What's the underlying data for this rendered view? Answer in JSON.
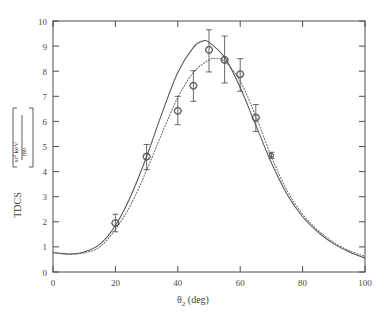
{
  "figure": {
    "background_color": "#ffffff",
    "line_color": "#4d4d4d"
  },
  "chart_data": {
    "type": "scatter",
    "title": "",
    "subtitle": "",
    "xlabel": "θ₂ (deg)",
    "xlabel_symbol": "θ",
    "xlabel_subscript": "2",
    "xlabel_units": "(deg)",
    "ylabel": "TDCS [ mb / (sr² keV) ]",
    "ylabel_main": "TDCS",
    "ylabel_numerator": "mb",
    "ylabel_denominator": "sr² keV",
    "xlim": [
      0,
      100
    ],
    "ylim": [
      0,
      10
    ],
    "xticks": [
      0,
      20,
      40,
      60,
      80,
      100
    ],
    "yticks": [
      0,
      1,
      2,
      3,
      4,
      5,
      6,
      7,
      8,
      9,
      10
    ],
    "xtick_labels": [
      "0",
      "20",
      "40",
      "60",
      "80",
      "100"
    ],
    "ytick_labels": [
      "0",
      "1",
      "2",
      "3",
      "4",
      "5",
      "6",
      "7",
      "8",
      "9",
      "10"
    ],
    "grid": false,
    "legend": false,
    "legend_position": "none",
    "series": [
      {
        "name": "experiment",
        "type": "scatter",
        "marker": "diamond-in-circle",
        "color": "#4a4a4a",
        "points": [
          {
            "x": 20,
            "y": 1.95,
            "yerr_low": 0.35,
            "yerr_high": 0.35
          },
          {
            "x": 30,
            "y": 4.6,
            "yerr_low": 0.52,
            "yerr_high": 0.48
          },
          {
            "x": 40,
            "y": 6.42,
            "yerr_low": 0.55,
            "yerr_high": 0.58
          },
          {
            "x": 45,
            "y": 7.42,
            "yerr_low": 0.62,
            "yerr_high": 0.6
          },
          {
            "x": 50,
            "y": 8.85,
            "yerr_low": 0.88,
            "yerr_high": 0.8
          },
          {
            "x": 55,
            "y": 8.45,
            "yerr_low": 0.92,
            "yerr_high": 0.95
          },
          {
            "x": 60,
            "y": 7.88,
            "yerr_low": 0.68,
            "yerr_high": 0.62
          },
          {
            "x": 65,
            "y": 6.15,
            "yerr_low": 0.55,
            "yerr_high": 0.52
          },
          {
            "x": 70,
            "y": 4.65,
            "yerr_low": 0.12,
            "yerr_high": 0.12
          }
        ]
      },
      {
        "name": "theory-solid",
        "type": "line",
        "style": "solid",
        "color": "#55555a",
        "x": [
          0,
          5,
          10,
          15,
          20,
          25,
          30,
          35,
          40,
          45,
          48,
          50,
          55,
          60,
          65,
          70,
          75,
          80,
          85,
          90,
          95,
          100
        ],
        "y": [
          0.78,
          0.72,
          0.8,
          1.1,
          1.85,
          3.05,
          4.6,
          6.35,
          7.95,
          8.95,
          9.2,
          9.15,
          8.55,
          7.35,
          5.85,
          4.35,
          3.1,
          2.2,
          1.58,
          1.12,
          0.8,
          0.55
        ]
      },
      {
        "name": "theory-dotted",
        "type": "line",
        "style": "dotted",
        "color": "#6a6a70",
        "x": [
          0,
          5,
          10,
          15,
          20,
          25,
          30,
          35,
          40,
          45,
          50,
          52,
          55,
          60,
          65,
          70,
          75,
          80,
          85,
          90,
          95,
          100
        ],
        "y": [
          0.76,
          0.7,
          0.76,
          1.0,
          1.7,
          2.7,
          4.05,
          5.55,
          6.95,
          7.95,
          8.45,
          8.5,
          8.4,
          7.6,
          6.2,
          4.6,
          3.25,
          2.3,
          1.65,
          1.18,
          0.85,
          0.62
        ]
      }
    ]
  }
}
